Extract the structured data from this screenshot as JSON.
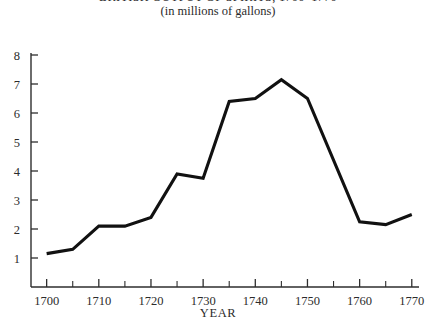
{
  "chart_data": {
    "type": "line",
    "title": "BRITISH OUTPUT OF SPIRITS, 1700–1770",
    "subtitle": "(in millions of gallons)",
    "xlabel": "YEAR",
    "ylabel": "",
    "xlim": [
      1697,
      1771
    ],
    "ylim": [
      0,
      8
    ],
    "grid": false,
    "legend": null,
    "x_major_ticks": [
      1700,
      1710,
      1720,
      1730,
      1740,
      1750,
      1760,
      1770
    ],
    "x_major_tick_labels": [
      "1700",
      "1710",
      "1720",
      "1730",
      "1740",
      "1750",
      "1760",
      "1770"
    ],
    "x_minor_ticks": [
      1705,
      1715,
      1725,
      1735,
      1745,
      1755,
      1765
    ],
    "y_ticks": [
      1,
      2,
      3,
      4,
      5,
      6,
      7,
      8
    ],
    "y_tick_labels": [
      "1",
      "2",
      "3",
      "4",
      "5",
      "6",
      "7",
      "8"
    ],
    "line_color": "#111111",
    "x": [
      1700,
      1705,
      1710,
      1715,
      1720,
      1725,
      1730,
      1735,
      1740,
      1745,
      1750,
      1760,
      1765,
      1770
    ],
    "values": [
      1.15,
      1.3,
      2.1,
      2.1,
      2.4,
      3.9,
      3.75,
      6.4,
      6.5,
      7.15,
      6.5,
      2.25,
      2.15,
      2.5
    ],
    "series": [
      {
        "name": "British output of spirits",
        "x": [
          1700,
          1705,
          1710,
          1715,
          1720,
          1725,
          1730,
          1735,
          1740,
          1745,
          1750,
          1760,
          1765,
          1770
        ],
        "values": [
          1.15,
          1.3,
          2.1,
          2.1,
          2.4,
          3.9,
          3.75,
          6.4,
          6.5,
          7.15,
          6.5,
          2.25,
          2.15,
          2.5
        ]
      }
    ]
  }
}
